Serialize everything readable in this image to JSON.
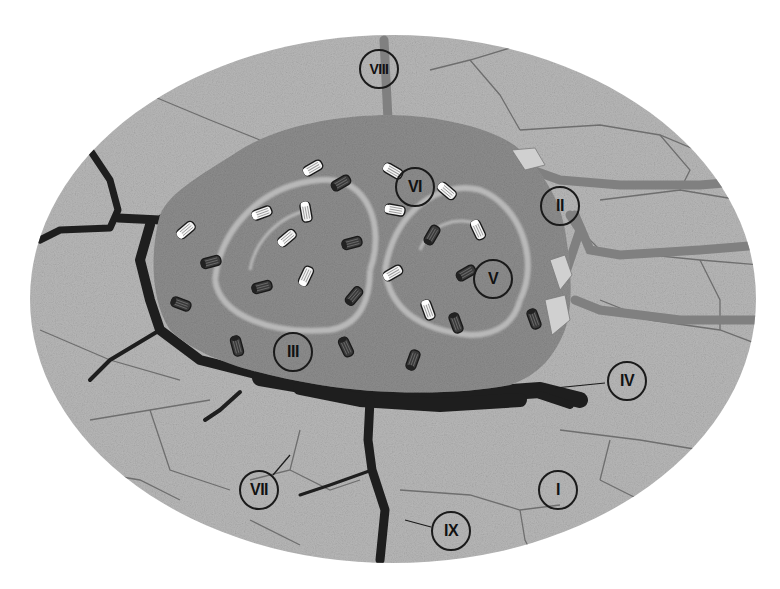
{
  "figure": {
    "top_title_fragment": "",
    "colors": {
      "background": "#ffffff",
      "substrate": "#b9b9b9",
      "matrix": "#8e8e8e",
      "matrix_swirl": "#c8c8c8",
      "channel_dark": "#1e1e1e",
      "channel_mid": "#707070",
      "rod_light": "#f2f2f2",
      "rod_dark": "#3a3a3a",
      "outline": "#1a1a1a"
    }
  },
  "labels": [
    {
      "id": "I",
      "text": "I",
      "x": 558,
      "y": 490
    },
    {
      "id": "II",
      "text": "II",
      "x": 560,
      "y": 206
    },
    {
      "id": "III",
      "text": "III",
      "x": 293,
      "y": 352
    },
    {
      "id": "IV",
      "text": "IV",
      "x": 627,
      "y": 381
    },
    {
      "id": "V",
      "text": "V",
      "x": 493,
      "y": 279
    },
    {
      "id": "VI",
      "text": "VI",
      "x": 415,
      "y": 187
    },
    {
      "id": "VII",
      "text": "VII",
      "x": 259,
      "y": 490
    },
    {
      "id": "VIII",
      "text": "VIII",
      "x": 379,
      "y": 69
    },
    {
      "id": "IX",
      "text": "IX",
      "x": 451,
      "y": 531
    }
  ],
  "rods": [
    {
      "x": 313,
      "y": 168,
      "a": -30,
      "tone": "light"
    },
    {
      "x": 341,
      "y": 183,
      "a": -30,
      "tone": "dark"
    },
    {
      "x": 393,
      "y": 171,
      "a": 30,
      "tone": "light"
    },
    {
      "x": 447,
      "y": 191,
      "a": 40,
      "tone": "light"
    },
    {
      "x": 395,
      "y": 210,
      "a": 10,
      "tone": "light"
    },
    {
      "x": 262,
      "y": 213,
      "a": -20,
      "tone": "light"
    },
    {
      "x": 306,
      "y": 212,
      "a": 80,
      "tone": "light"
    },
    {
      "x": 186,
      "y": 230,
      "a": -40,
      "tone": "light"
    },
    {
      "x": 287,
      "y": 238,
      "a": -40,
      "tone": "light"
    },
    {
      "x": 352,
      "y": 243,
      "a": -15,
      "tone": "dark"
    },
    {
      "x": 432,
      "y": 235,
      "a": -60,
      "tone": "dark"
    },
    {
      "x": 478,
      "y": 230,
      "a": 65,
      "tone": "light"
    },
    {
      "x": 211,
      "y": 262,
      "a": -15,
      "tone": "dark"
    },
    {
      "x": 262,
      "y": 287,
      "a": -15,
      "tone": "dark"
    },
    {
      "x": 306,
      "y": 276,
      "a": -65,
      "tone": "light"
    },
    {
      "x": 393,
      "y": 273,
      "a": -30,
      "tone": "light"
    },
    {
      "x": 466,
      "y": 273,
      "a": -30,
      "tone": "dark"
    },
    {
      "x": 181,
      "y": 304,
      "a": 20,
      "tone": "dark"
    },
    {
      "x": 354,
      "y": 296,
      "a": -50,
      "tone": "dark"
    },
    {
      "x": 428,
      "y": 310,
      "a": 70,
      "tone": "light"
    },
    {
      "x": 456,
      "y": 323,
      "a": 70,
      "tone": "dark"
    },
    {
      "x": 534,
      "y": 319,
      "a": 70,
      "tone": "dark"
    },
    {
      "x": 237,
      "y": 346,
      "a": 75,
      "tone": "dark"
    },
    {
      "x": 346,
      "y": 347,
      "a": 65,
      "tone": "dark"
    },
    {
      "x": 413,
      "y": 360,
      "a": -70,
      "tone": "dark"
    }
  ]
}
